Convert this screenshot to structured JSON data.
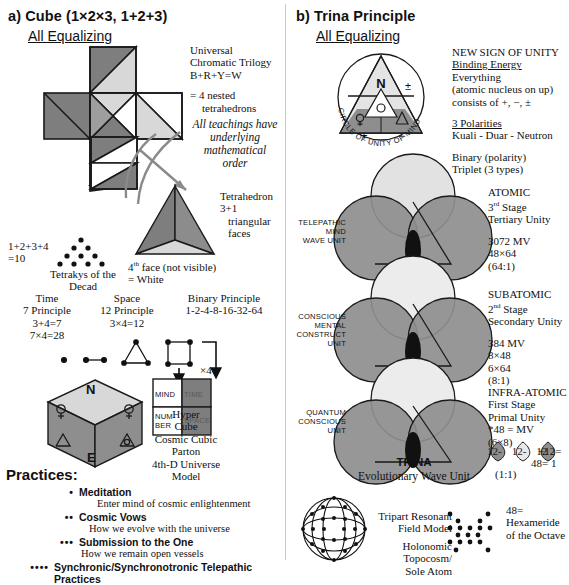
{
  "panels": {
    "left": {
      "heading": "a) Cube (1×2×3, 1+2+3)",
      "subheading": "All Equalizing",
      "trilogy": {
        "line1": "Universal",
        "line2": "Chromatic Trilogy",
        "line3": "B+R+Y=W",
        "line4": "= 4 nested",
        "line5": "tetrahedrons"
      },
      "teaching_note": "All teachings have underlying mathematical order",
      "tetrahedron": {
        "label1": "Tetrahedron",
        "label2": "3+1",
        "label3": "triangular",
        "label4": "faces",
        "note1": "4",
        "note1sup": "th",
        "note1b": " face (not visible)",
        "note2": "= White"
      },
      "tetraktys": {
        "eq1": "1+2+3+4",
        "eq2": "=10",
        "caption1": "Tetrakys of the",
        "caption2": "Decad"
      },
      "principles": [
        {
          "title": "Time",
          "sub": "7 Principle",
          "l1": "3+4=7",
          "l2": "7×4=28"
        },
        {
          "title": "Space",
          "sub": "12 Principle",
          "l1": "3×4=12",
          "l2": ""
        },
        {
          "title": "Binary Principle",
          "sub": "1-2-4-8-16-32-64",
          "l1": "",
          "l2": ""
        }
      ],
      "x4_label": "×4",
      "quad": {
        "mind": "MIND",
        "time": "TIME",
        "number": "NUM-BER",
        "space": "SPACE"
      },
      "hypercube": {
        "top": "N",
        "bottom": "E",
        "caption1": "Hyper",
        "caption2": "Cube",
        "caption3": "Cosmic Cubic",
        "caption4": "Parton",
        "caption5": "4th-D Universe",
        "caption6": "Model"
      },
      "practices": {
        "title": "Practices:",
        "items": [
          {
            "bullets": "•",
            "name": "Meditation",
            "desc": "Enter mind of cosmic enlightenment"
          },
          {
            "bullets": "••",
            "name": "Cosmic Vows",
            "desc": "How we evolve with the universe"
          },
          {
            "bullets": "•••",
            "name": "Submission to the One",
            "desc": "How we remain open vessels"
          },
          {
            "bullets": "••••",
            "name": "Synchronic/Synchronotronic Telepathic Practices",
            "desc": ""
          }
        ]
      }
    },
    "right": {
      "heading": "b) Trina Principle",
      "subheading": "All Equalizing",
      "circle_of_unity": {
        "ring_text": "CIRCLE OF UNITY OF MIND",
        "apex": "N",
        "plus_minus": "±",
        "plus": "+",
        "minus": "−"
      },
      "unity_notes": {
        "l1": "NEW SIGN OF UNITY",
        "l2": "Binding Energy",
        "l3": "Everything",
        "l4": "(atomic nucleus on up)",
        "l5": "consists of +, −, ±",
        "l6": "3 Polarities",
        "l7": "Kuali - Duar - Neutron",
        "l8": "Binary (polarity)",
        "l9": "Triplet (3 types)"
      },
      "stages": [
        {
          "left_label": [
            "TELEPATHIC",
            "MIND",
            "WAVE UNIT"
          ],
          "right_title": "ATOMIC",
          "right_stage_num": "3",
          "right_stage_sup": "rd",
          "right_stage_word": " Stage",
          "right_unity": "Tertiary Unity",
          "values": [
            "3072   MV",
            "48×64",
            "(64:1)"
          ]
        },
        {
          "left_label": [
            "CONSCIOUS",
            "MENTAL",
            "CONSTRUCT",
            "UNIT"
          ],
          "right_title": "SUBATOMIC",
          "right_stage_num": "2",
          "right_stage_sup": "nd",
          "right_stage_word": " Stage",
          "right_unity": "Secondary Unity",
          "values": [
            "384   MV",
            "8×48",
            "6×64",
            "(8:1)"
          ]
        },
        {
          "left_label": [
            "QUANTUM",
            "CONSCIOUS",
            "UNIT"
          ],
          "right_title": "INFRA-ATOMIC",
          "right_stage_num": "",
          "right_stage_sup": "",
          "right_stage_word": "First Stage",
          "right_unity": "Primal Unity",
          "values": [
            "*48 = MV",
            "(6×8)"
          ]
        }
      ],
      "trina": {
        "title": "TRINA",
        "subtitle": "Evolutionary Wave Unit"
      },
      "equation": {
        "c1": "12",
        "sep1": "-",
        "c2": "12",
        "sep2": "-",
        "c3": "12",
        "tail": "+12=",
        "result": "48= 1",
        "ratio": "(1:1)"
      },
      "footer": {
        "field_model_1": "Tripart Resonant",
        "field_model_2": "Field Model",
        "field_model_3": "Holonomic",
        "field_model_4": "Topocosm/",
        "field_model_5": "Sole Atom",
        "hex_1": "48=",
        "hex_2": "Hexameride",
        "hex_3": "of the Octave"
      }
    }
  },
  "colors": {
    "dark_gray": "#7e7e7e",
    "mid_gray": "#9e9e9e",
    "light_gray": "#d8d8d8",
    "pale_gray": "#eeeeee",
    "white": "#ffffff",
    "stroke": "#1a1a1a"
  }
}
